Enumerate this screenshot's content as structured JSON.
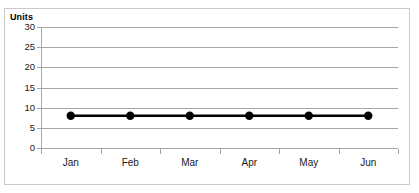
{
  "chart_data": {
    "type": "line",
    "title": "",
    "subtitle": "",
    "xlabel": "",
    "ylabel": "Units",
    "categories": [
      "Jan",
      "Feb",
      "Mar",
      "Apr",
      "May",
      "Jun"
    ],
    "series": [
      {
        "name": "Units",
        "values": [
          8,
          8,
          8,
          8,
          8,
          8
        ],
        "color": "#000000",
        "marker": "circle",
        "marker_color": "#000000"
      }
    ],
    "ylim": [
      0,
      30
    ],
    "yticks": [
      0,
      5,
      10,
      15,
      20,
      25,
      30
    ],
    "ytick_labels": [
      "0",
      "5",
      "10",
      "15",
      "20",
      "25",
      "30"
    ],
    "grid": true,
    "grid_axis": "y",
    "grid_color": "#a6a6a6",
    "legend": false,
    "legend_position": "none",
    "axis_color": "#a6a6a6",
    "plot_background": "#ffffff",
    "border_color": "#c9c9c9"
  },
  "axis": {
    "y_title": "Units"
  }
}
